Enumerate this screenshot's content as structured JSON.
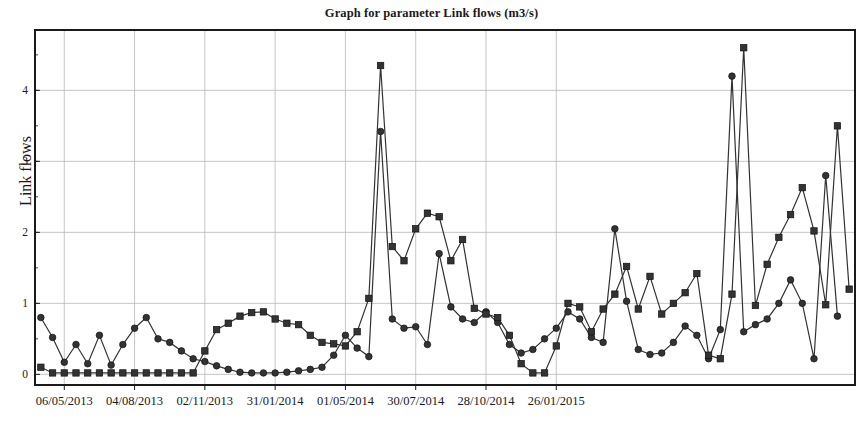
{
  "chart_data": {
    "type": "line",
    "title": "Graph for parameter Link flows (m3/s)",
    "xlabel": "",
    "ylabel": "Link flows",
    "ylim": [
      -0.15,
      4.85
    ],
    "yticks": [
      0,
      1,
      2,
      3,
      4
    ],
    "ytick_labels": [
      "0",
      "1",
      "2",
      "3",
      "4"
    ],
    "grid": true,
    "legend": "none",
    "xtick_labels": [
      "06/05/2013",
      "04/08/2013",
      "02/11/2013",
      "31/01/2014",
      "01/05/2014",
      "30/07/2014",
      "28/10/2014",
      "26/01/2015"
    ],
    "xtick_indices": [
      2,
      8,
      14,
      20,
      26,
      32,
      38,
      44
    ],
    "x": [
      0,
      1,
      2,
      3,
      4,
      5,
      6,
      7,
      8,
      9,
      10,
      11,
      12,
      13,
      14,
      15,
      16,
      17,
      18,
      19,
      20,
      21,
      22,
      23,
      24,
      25,
      26,
      27,
      28,
      29,
      30,
      31,
      32,
      33,
      34,
      35,
      36,
      37,
      38,
      39,
      40,
      41,
      42,
      43,
      44,
      45,
      46,
      47,
      48
    ],
    "series": [
      {
        "name": "Series 1",
        "marker": "square",
        "color": "#333333",
        "values": [
          0.1,
          0.02,
          0.02,
          0.02,
          0.02,
          0.02,
          0.02,
          0.02,
          0.02,
          0.02,
          0.02,
          0.02,
          0.02,
          0.02,
          0.33,
          0.63,
          0.72,
          0.82,
          0.87,
          0.88,
          0.78,
          0.72,
          0.7,
          0.55,
          0.45,
          0.43,
          0.4,
          0.6,
          1.07,
          4.35,
          1.8,
          1.6,
          2.05,
          2.27,
          2.22,
          1.6,
          1.9,
          0.93,
          0.85,
          0.8,
          0.55,
          0.15,
          0.02,
          0.02,
          0.4,
          1.0,
          0.95,
          0.6,
          0.92
        ]
      },
      {
        "name": "Series 2",
        "marker": "circle",
        "color": "#333333",
        "values": [
          0.8,
          0.52,
          0.17,
          0.42,
          0.15,
          0.55,
          0.13,
          0.42,
          0.65,
          0.8,
          0.5,
          0.45,
          0.33,
          0.22,
          0.18,
          0.12,
          0.07,
          0.03,
          0.02,
          0.02,
          0.02,
          0.03,
          0.05,
          0.07,
          0.1,
          0.27,
          0.55,
          0.37,
          0.25,
          3.42,
          0.78,
          0.65,
          0.67,
          0.42,
          1.7,
          0.95,
          0.78,
          0.73,
          0.88,
          0.73,
          0.42,
          0.3,
          0.35,
          0.5,
          0.65,
          0.88,
          0.78,
          0.52,
          0.45
        ]
      }
    ],
    "extended_series": [
      {
        "name": "Series 1 (continued right half)",
        "marker": "square",
        "values": [
          1.13,
          1.52,
          0.92,
          1.38,
          0.85,
          1.0,
          1.15,
          1.42,
          0.27,
          0.22,
          1.13,
          4.6,
          0.97,
          1.55,
          1.93,
          2.25,
          2.63,
          2.02,
          0.98,
          3.5,
          1.2
        ]
      },
      {
        "name": "Series 2 (continued right half)",
        "marker": "circle",
        "values": [
          2.05,
          1.03,
          0.35,
          0.28,
          0.3,
          0.45,
          0.68,
          0.55,
          0.22,
          0.63,
          4.2,
          0.6,
          0.7,
          0.78,
          1.0,
          1.33,
          1.0,
          0.22,
          2.8,
          0.82
        ]
      }
    ],
    "annotations": [
      {
        "label": "peak-1",
        "series": "square",
        "value": 4.35
      },
      {
        "label": "peak-1-circle",
        "series": "circle",
        "value": 3.42
      },
      {
        "label": "peak-2",
        "series": "square",
        "value": 4.6
      },
      {
        "label": "peak-2-circle",
        "series": "circle",
        "value": 4.2
      },
      {
        "label": "peak-3",
        "series": "square",
        "value": 3.5
      }
    ]
  },
  "plot": {
    "left": 35,
    "right": 855,
    "top": 30,
    "bottom": 385,
    "axis_color": "#1a1a1a",
    "grid_color": "#b8b8b8",
    "background": "#ffffff"
  }
}
